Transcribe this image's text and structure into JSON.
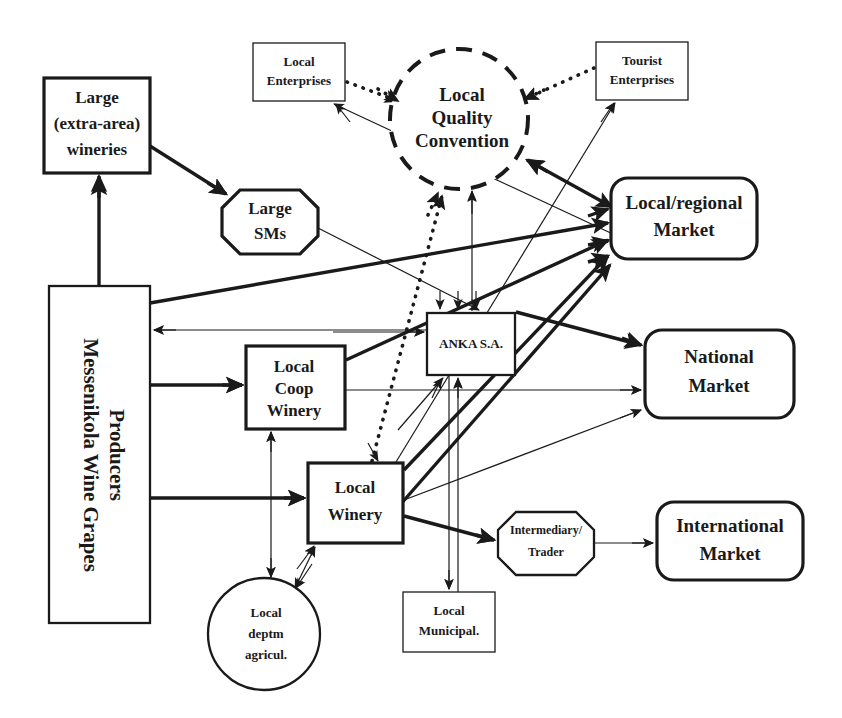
{
  "diagram": {
    "background_color": "#ffffff",
    "line_color": "#1a1a1a",
    "nodes": [
      {
        "id": "large_wineries",
        "label_lines": [
          "Large",
          "(extra-area)",
          "wineries"
        ],
        "shape": "rect",
        "x": 44,
        "y": 78,
        "w": 106,
        "h": 95
      },
      {
        "id": "local_enterprises",
        "label_lines": [
          "Local",
          "Enterprises"
        ],
        "shape": "rect-thin",
        "x": 253,
        "y": 43,
        "w": 92,
        "h": 58
      },
      {
        "id": "lqc",
        "label_lines": [
          "Local",
          "Quality",
          "Convention"
        ],
        "shape": "dashed-circle",
        "x": 390,
        "y": 49,
        "w": 138,
        "h": 140
      },
      {
        "id": "tourist_enterprises",
        "label_lines": [
          "Tourist",
          "Enterprises"
        ],
        "shape": "rect-thin",
        "x": 596,
        "y": 42,
        "w": 92,
        "h": 58
      },
      {
        "id": "large_sms",
        "label_lines": [
          "Large",
          "SMs"
        ],
        "shape": "octagon",
        "x": 222,
        "y": 190,
        "w": 96,
        "h": 64
      },
      {
        "id": "local_regional",
        "label_lines": [
          "Local/regional",
          "Market"
        ],
        "shape": "rounded",
        "x": 611,
        "y": 178,
        "w": 146,
        "h": 81
      },
      {
        "id": "messenikola",
        "label_lines": [
          "Messenikola Wine Grapes",
          "Producers"
        ],
        "shape": "rect-vert",
        "x": 49,
        "y": 286,
        "w": 101,
        "h": 337
      },
      {
        "id": "anka",
        "label_lines": [
          "ANKA S.A."
        ],
        "shape": "rect",
        "x": 427,
        "y": 313,
        "w": 88,
        "h": 62
      },
      {
        "id": "coop_winery",
        "label_lines": [
          "Local",
          "Coop",
          "Winery"
        ],
        "shape": "rect",
        "x": 246,
        "y": 346,
        "w": 99,
        "h": 83
      },
      {
        "id": "national_market",
        "label_lines": [
          "National",
          "Market"
        ],
        "shape": "rounded",
        "x": 645,
        "y": 330,
        "w": 149,
        "h": 88
      },
      {
        "id": "local_winery",
        "label_lines": [
          "Local",
          "Winery"
        ],
        "shape": "rect",
        "x": 308,
        "y": 463,
        "w": 95,
        "h": 80
      },
      {
        "id": "intermediary",
        "label_lines": [
          "Intermediary/",
          "Trader"
        ],
        "shape": "octagon",
        "x": 498,
        "y": 512,
        "w": 96,
        "h": 63
      },
      {
        "id": "international",
        "label_lines": [
          "International",
          "Market"
        ],
        "shape": "rounded",
        "x": 657,
        "y": 502,
        "w": 146,
        "h": 78
      },
      {
        "id": "deptm_agricul",
        "label_lines": [
          "Local",
          "deptm",
          "agricul."
        ],
        "shape": "circle",
        "x": 208,
        "y": 578,
        "w": 112,
        "h": 112
      },
      {
        "id": "local_municipal",
        "label_lines": [
          "Local",
          "Municipal."
        ],
        "shape": "rect-thin",
        "x": 403,
        "y": 592,
        "w": 92,
        "h": 60
      }
    ],
    "edges": [
      {
        "from": "messenikola",
        "to": "large_wineries",
        "style": "thick"
      },
      {
        "from": "large_wineries",
        "to": "large_sms",
        "style": "thick"
      },
      {
        "from": "local_enterprises",
        "to": "lqc",
        "style": "dotted"
      },
      {
        "from": "tourist_enterprises",
        "to": "lqc",
        "style": "dotted"
      },
      {
        "from": "local_winery",
        "to": "lqc",
        "style": "dotted"
      },
      {
        "from": "local_regional",
        "to": "lqc",
        "style": "thick"
      },
      {
        "from": "anka",
        "to": "lqc",
        "style": "thin"
      },
      {
        "from": "messenikola",
        "to": "large_sms_market",
        "style": "thick"
      },
      {
        "from": "large_sms",
        "to": "anka",
        "style": "thin"
      },
      {
        "from": "messenikola",
        "to": "local_regional",
        "style": "thick"
      },
      {
        "from": "coop_winery",
        "to": "local_regional",
        "style": "thick"
      },
      {
        "from": "local_winery",
        "to": "local_regional",
        "style": "thick"
      },
      {
        "from": "anka",
        "to": "messenikola",
        "style": "thin"
      },
      {
        "from": "messenikola",
        "to": "coop_winery",
        "style": "thick"
      },
      {
        "from": "messenikola",
        "to": "local_winery",
        "style": "thick"
      },
      {
        "from": "coop_winery",
        "to": "national_market",
        "style": "thin"
      },
      {
        "from": "local_winery",
        "to": "national_market",
        "style": "thin"
      },
      {
        "from": "anka",
        "to": "national_market",
        "style": "thick"
      },
      {
        "from": "coop_winery",
        "to": "anka",
        "style": "thin"
      },
      {
        "from": "local_winery",
        "to": "anka",
        "style": "thin"
      },
      {
        "from": "anka",
        "to": "local_municipal",
        "style": "thin"
      },
      {
        "from": "coop_winery",
        "to": "deptm_agricul",
        "style": "thin"
      },
      {
        "from": "deptm_agricul",
        "to": "local_winery",
        "style": "thin"
      },
      {
        "from": "local_winery",
        "to": "intermediary",
        "style": "thick"
      },
      {
        "from": "intermediary",
        "to": "international",
        "style": "thin"
      },
      {
        "from": "local_winery",
        "to": "tourist_enterprises",
        "style": "thin"
      },
      {
        "from": "local_regional",
        "to": "local_enterprises",
        "style": "thin"
      }
    ]
  }
}
